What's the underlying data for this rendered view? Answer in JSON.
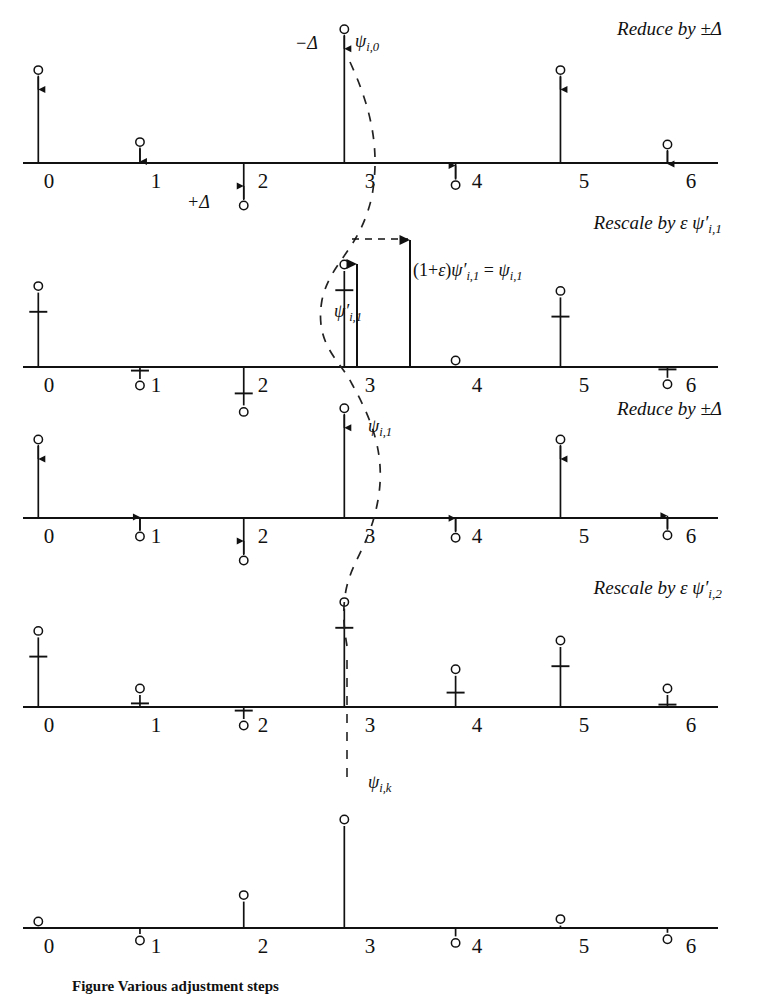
{
  "figure": {
    "axis_tick_labels": [
      "0",
      "1",
      "2",
      "3",
      "4",
      "5",
      "6"
    ],
    "colors": {
      "ink": "#111111",
      "background": "#ffffff",
      "dashed": "#222222"
    }
  },
  "operations": [
    {
      "id": "op1",
      "text": "Reduce by ±Δ"
    },
    {
      "id": "op2",
      "text": "Rescale by ε ψ′i,1"
    },
    {
      "id": "op3",
      "text": "Reduce by ±Δ"
    },
    {
      "id": "op4",
      "text": "Rescale by ε ψ′i,2"
    }
  ],
  "annotations": {
    "minus_delta": "−Δ",
    "plus_delta": "+Δ",
    "psi_i_0": "ψi,0",
    "psi_prime_i_1": "ψ′i,1",
    "rescale_equation": "(1+ε)ψ′i,1 = ψi,1",
    "psi_i_1": "ψi,1",
    "psi_i_k": "ψi,k"
  },
  "caption": "Figure  Various adjustment steps",
  "chart_data": {
    "type": "line",
    "xlabel": "",
    "ylabel": "",
    "xlim": [
      -0.3,
      6.4
    ],
    "grid": false,
    "legend": null,
    "panels": [
      {
        "name": "panel-1-initial",
        "operation": "Reduce by ±Δ",
        "x": [
          -0.1,
          0.85,
          1.82,
          2.76,
          3.8,
          4.78,
          5.78
        ],
        "values": [
          0.72,
          0.12,
          -0.3,
          1.06,
          -0.13,
          0.72,
          0.1
        ],
        "arrows": [
          "down",
          "down",
          "up",
          "down",
          "up",
          "down",
          "down"
        ],
        "markers": [
          "circle",
          "circle",
          "circle",
          "circle",
          "circle",
          "circle",
          "circle"
        ]
      },
      {
        "name": "panel-2-reduced-rescale",
        "operation": "Rescale by ε ψ′i,1",
        "x": [
          -0.1,
          0.85,
          1.82,
          2.76,
          3.8,
          4.78,
          5.78
        ],
        "values": [
          0.62,
          -0.1,
          -0.32,
          0.8,
          0.0,
          0.58,
          -0.09
        ],
        "reduced_values": [
          0.46,
          -0.03,
          -0.22,
          0.64,
          0.0,
          0.42,
          -0.02
        ],
        "arrows": [
          "none",
          "none",
          "none",
          "none",
          "none",
          "none",
          "none"
        ],
        "markers": [
          "circle",
          "circle",
          "circle",
          "circle",
          "circle",
          "circle",
          "circle"
        ]
      },
      {
        "name": "panel-3-after-rescale",
        "operation": "Reduce by ±Δ",
        "x": [
          -0.1,
          0.85,
          1.82,
          2.76,
          3.8,
          4.78,
          5.78
        ],
        "values": [
          0.6,
          -0.1,
          -0.3,
          0.86,
          -0.11,
          0.6,
          -0.09
        ],
        "arrows": [
          "down",
          "up",
          "up",
          "down",
          "up",
          "down",
          "up"
        ],
        "markers": [
          "circle",
          "circle",
          "circle",
          "circle",
          "circle",
          "circle",
          "circle"
        ]
      },
      {
        "name": "panel-4-second-rescale",
        "operation": "Rescale by ε ψ′i,2",
        "x": [
          -0.1,
          0.85,
          1.82,
          2.76,
          3.8,
          4.78,
          5.78
        ],
        "values": [
          0.58,
          0.1,
          -0.1,
          0.82,
          0.26,
          0.5,
          0.1
        ],
        "reduced_values": [
          0.42,
          0.03,
          -0.03,
          0.66,
          0.12,
          0.34,
          0.02
        ],
        "arrows": [
          "none",
          "none",
          "none",
          "none",
          "none",
          "none",
          "none"
        ],
        "markers": [
          "circle",
          "circle",
          "circle",
          "circle",
          "circle",
          "circle",
          "circle"
        ]
      },
      {
        "name": "panel-5-converged",
        "operation": "",
        "x": [
          -0.1,
          0.85,
          1.82,
          2.76,
          3.8,
          4.78,
          5.78
        ],
        "values": [
          0.0,
          -0.05,
          0.22,
          0.85,
          -0.07,
          0.02,
          -0.04
        ],
        "arrows": [
          "none",
          "none",
          "none",
          "none",
          "none",
          "none",
          "none"
        ],
        "markers": [
          "circle",
          "circle",
          "circle",
          "circle",
          "circle",
          "circle",
          "circle"
        ]
      }
    ]
  }
}
